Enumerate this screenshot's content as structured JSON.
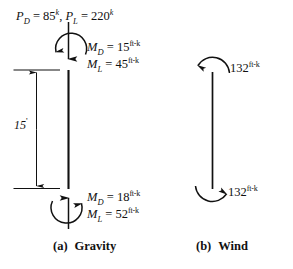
{
  "figure": {
    "title_a": "(a)  Gravity",
    "title_b": "(b)  Wind"
  },
  "panel_a": {
    "caption_index": "(a)",
    "caption_name": "Gravity",
    "axial_loads": {
      "dead_symbol": "P",
      "dead_sub": "D",
      "dead_eq": " = ",
      "dead_value": "85",
      "dead_unit": "k",
      "separator": ", ",
      "live_symbol": "P",
      "live_sub": "L",
      "live_eq": " = ",
      "live_value": "220",
      "live_unit": "k"
    },
    "top_moments": {
      "dead_symbol": "M",
      "dead_sub": "D",
      "dead_eq": " = ",
      "dead_value": "15",
      "dead_unit": "ft-k",
      "live_symbol": "M",
      "live_sub": "L",
      "live_eq": " = ",
      "live_value": "45",
      "live_unit": "ft-k"
    },
    "bottom_moments": {
      "dead_symbol": "M",
      "dead_sub": "D",
      "dead_eq": " = ",
      "dead_value": "18",
      "dead_unit": "ft-k",
      "live_symbol": "M",
      "live_sub": "L",
      "live_eq": " = ",
      "live_value": "52",
      "live_unit": "ft-k"
    },
    "dimension": {
      "value": "15",
      "unit": "'"
    }
  },
  "panel_b": {
    "caption_index": "(b)",
    "caption_name": "Wind",
    "top_moment": {
      "value": "132",
      "unit": "ft-k"
    },
    "bottom_moment": {
      "value": "132",
      "unit": "ft-k"
    }
  },
  "colors": {
    "ink": "#111111",
    "background": "#ffffff"
  }
}
